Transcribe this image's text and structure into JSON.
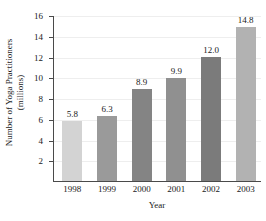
{
  "chart_data": {
    "type": "bar",
    "title": "",
    "categories": [
      "1998",
      "1999",
      "2000",
      "2001",
      "2002",
      "2003"
    ],
    "values": [
      5.8,
      6.3,
      8.9,
      9.9,
      12.0,
      14.8
    ],
    "value_labels": [
      "5.8",
      "6.3",
      "8.9",
      "9.9",
      "12.0",
      "14.8"
    ],
    "xlabel": "Year",
    "ylabel_line1": "Number of Yoga Practitioners",
    "ylabel_line2": "(millions)",
    "ylim": [
      0,
      16
    ],
    "yticks": [
      2,
      4,
      6,
      8,
      10,
      12,
      14,
      16
    ],
    "ytick_labels": [
      "2",
      "4",
      "6",
      "8",
      "10",
      "12",
      "14",
      "16"
    ],
    "grid": true,
    "legend": "none",
    "bar_colors": [
      "#d3d3d3",
      "#9a9a9a",
      "#848484",
      "#909090",
      "#7b7b7b",
      "#b2b2b2"
    ],
    "axis_color": "#4a4a4a",
    "grid_color": "#eeeeee",
    "text_color": "#1a1a1a"
  }
}
